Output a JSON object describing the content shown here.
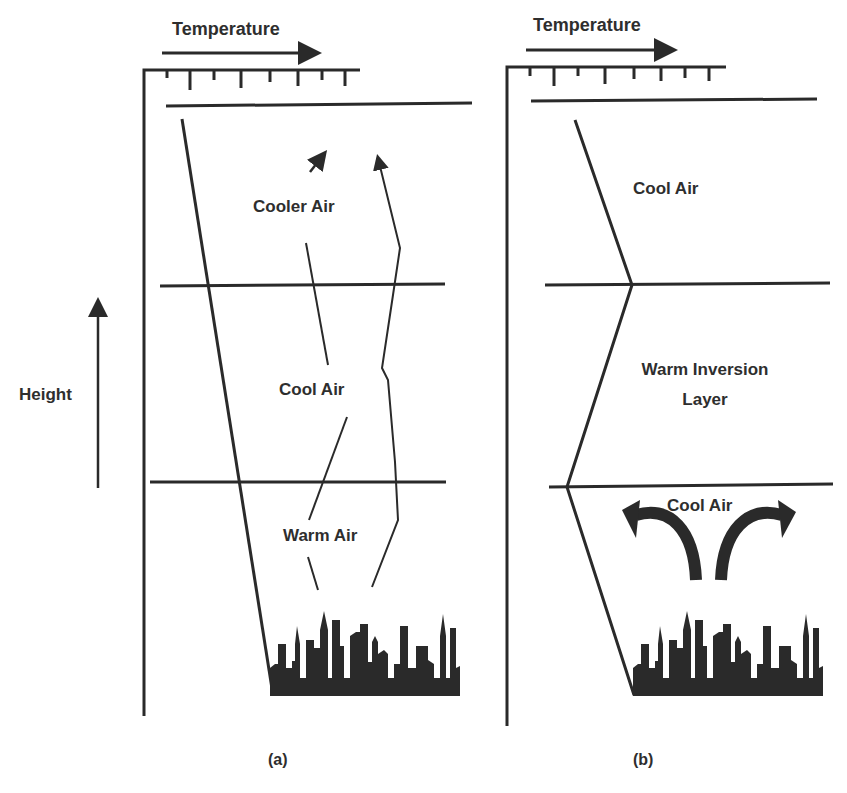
{
  "diagram": {
    "type": "temperature-inversion-comparison",
    "colors": {
      "ink": "#2a2a2a",
      "background": "#ffffff"
    },
    "axis_labels": {
      "height": "Height"
    },
    "panel_a": {
      "caption": "(a)",
      "temperature_label": "Temperature",
      "layers": [
        {
          "label": "Cooler Air"
        },
        {
          "label": "Cool Air"
        },
        {
          "label": "Warm Air"
        }
      ],
      "icons": [
        "up-arrow-icon",
        "rising-air-arrow-icon",
        "city-skyline-icon"
      ]
    },
    "panel_b": {
      "caption": "(b)",
      "temperature_label": "Temperature",
      "layers": [
        {
          "label": "Cool Air"
        },
        {
          "label": "Warm Inversion",
          "label_line2": "Layer"
        },
        {
          "label": "Cool Air"
        }
      ],
      "icons": [
        "curved-arrow-left-icon",
        "curved-arrow-right-icon",
        "city-skyline-icon"
      ]
    }
  }
}
